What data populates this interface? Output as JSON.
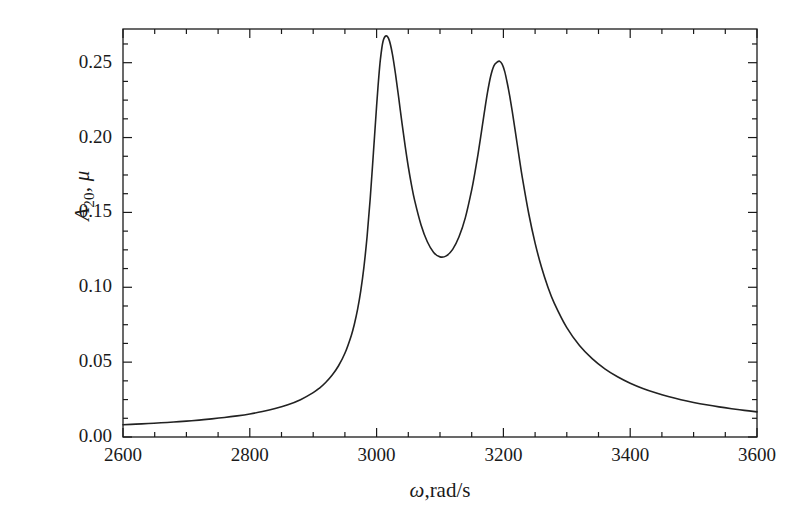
{
  "figure": {
    "background_color": "#ffffff",
    "line_color": "#222222",
    "axis_color": "#1a1a1a"
  },
  "chart_data": {
    "type": "line",
    "title": "",
    "subtitle": "",
    "xlabel": "ω,rad/s",
    "ylabel": "A20, μ",
    "ylabel_base": "A",
    "ylabel_sub": "20",
    "ylabel_tail": ", μ",
    "xlabel_symbol": "ω",
    "xlabel_unit": ",rad/s",
    "xlim": [
      2600,
      3600
    ],
    "ylim": [
      0.0,
      0.2725
    ],
    "grid": false,
    "legend": null,
    "xticks": [
      2600,
      2800,
      3000,
      3200,
      3400,
      3600
    ],
    "xticklabels": [
      "2600",
      "2800",
      "3000",
      "3200",
      "3400",
      "3600"
    ],
    "x_minor_tick_step": 50,
    "yticks": [
      0.0,
      0.05,
      0.1,
      0.15,
      0.2,
      0.25
    ],
    "yticklabels": [
      "0.00",
      "0.05",
      "0.10",
      "0.15",
      "0.20",
      "0.25"
    ],
    "y_minor_tick_step": 0.0125,
    "annotations": [],
    "series": [
      {
        "name": "A20 amplitude response",
        "color": "#222222",
        "linewidth": 1.6,
        "x": [
          2600,
          2620,
          2640,
          2660,
          2680,
          2700,
          2720,
          2740,
          2760,
          2780,
          2800,
          2820,
          2840,
          2860,
          2880,
          2900,
          2910,
          2920,
          2930,
          2940,
          2950,
          2960,
          2965,
          2970,
          2975,
          2980,
          2985,
          2990,
          2995,
          3000,
          3003,
          3006,
          3010,
          3015,
          3020,
          3025,
          3030,
          3035,
          3040,
          3045,
          3050,
          3055,
          3060,
          3070,
          3080,
          3090,
          3100,
          3110,
          3120,
          3130,
          3140,
          3150,
          3155,
          3160,
          3165,
          3170,
          3175,
          3180,
          3185,
          3190,
          3194,
          3198,
          3202,
          3206,
          3210,
          3215,
          3220,
          3225,
          3230,
          3240,
          3250,
          3260,
          3270,
          3280,
          3300,
          3320,
          3340,
          3360,
          3380,
          3400,
          3420,
          3440,
          3460,
          3480,
          3500,
          3520,
          3540,
          3560,
          3580,
          3600
        ],
        "y": [
          0.0082,
          0.0086,
          0.009,
          0.0095,
          0.01,
          0.0106,
          0.0113,
          0.0121,
          0.013,
          0.0141,
          0.0154,
          0.017,
          0.019,
          0.0215,
          0.0249,
          0.0296,
          0.0327,
          0.0366,
          0.0414,
          0.0476,
          0.0559,
          0.0677,
          0.0755,
          0.0852,
          0.0976,
          0.1135,
          0.1339,
          0.1596,
          0.19,
          0.2211,
          0.2381,
          0.2522,
          0.264,
          0.2679,
          0.2649,
          0.2556,
          0.2419,
          0.2261,
          0.2098,
          0.1944,
          0.1805,
          0.1684,
          0.158,
          0.1418,
          0.1304,
          0.1233,
          0.1203,
          0.121,
          0.1253,
          0.1337,
          0.1465,
          0.165,
          0.1764,
          0.189,
          0.2028,
          0.217,
          0.2303,
          0.2411,
          0.2479,
          0.2503,
          0.251,
          0.249,
          0.2442,
          0.2366,
          0.2277,
          0.2147,
          0.2006,
          0.1865,
          0.1729,
          0.1491,
          0.1295,
          0.1135,
          0.1004,
          0.0896,
          0.073,
          0.0611,
          0.0523,
          0.0455,
          0.0402,
          0.0359,
          0.0324,
          0.0295,
          0.027,
          0.0249,
          0.0231,
          0.0215,
          0.0201,
          0.0189,
          0.0178,
          0.0168
        ],
        "peaks": [
          {
            "x": 3014,
            "y": 0.268,
            "label": "first resonance peak"
          },
          {
            "x": 3194,
            "y": 0.251,
            "label": "second resonance peak"
          }
        ],
        "valley": {
          "x": 3100,
          "y": 0.147,
          "label": "antiresonance dip"
        },
        "endpoints": {
          "left": {
            "x": 2600,
            "y": 0.008
          },
          "right": {
            "x": 3600,
            "y": 0.006
          }
        }
      }
    ]
  }
}
